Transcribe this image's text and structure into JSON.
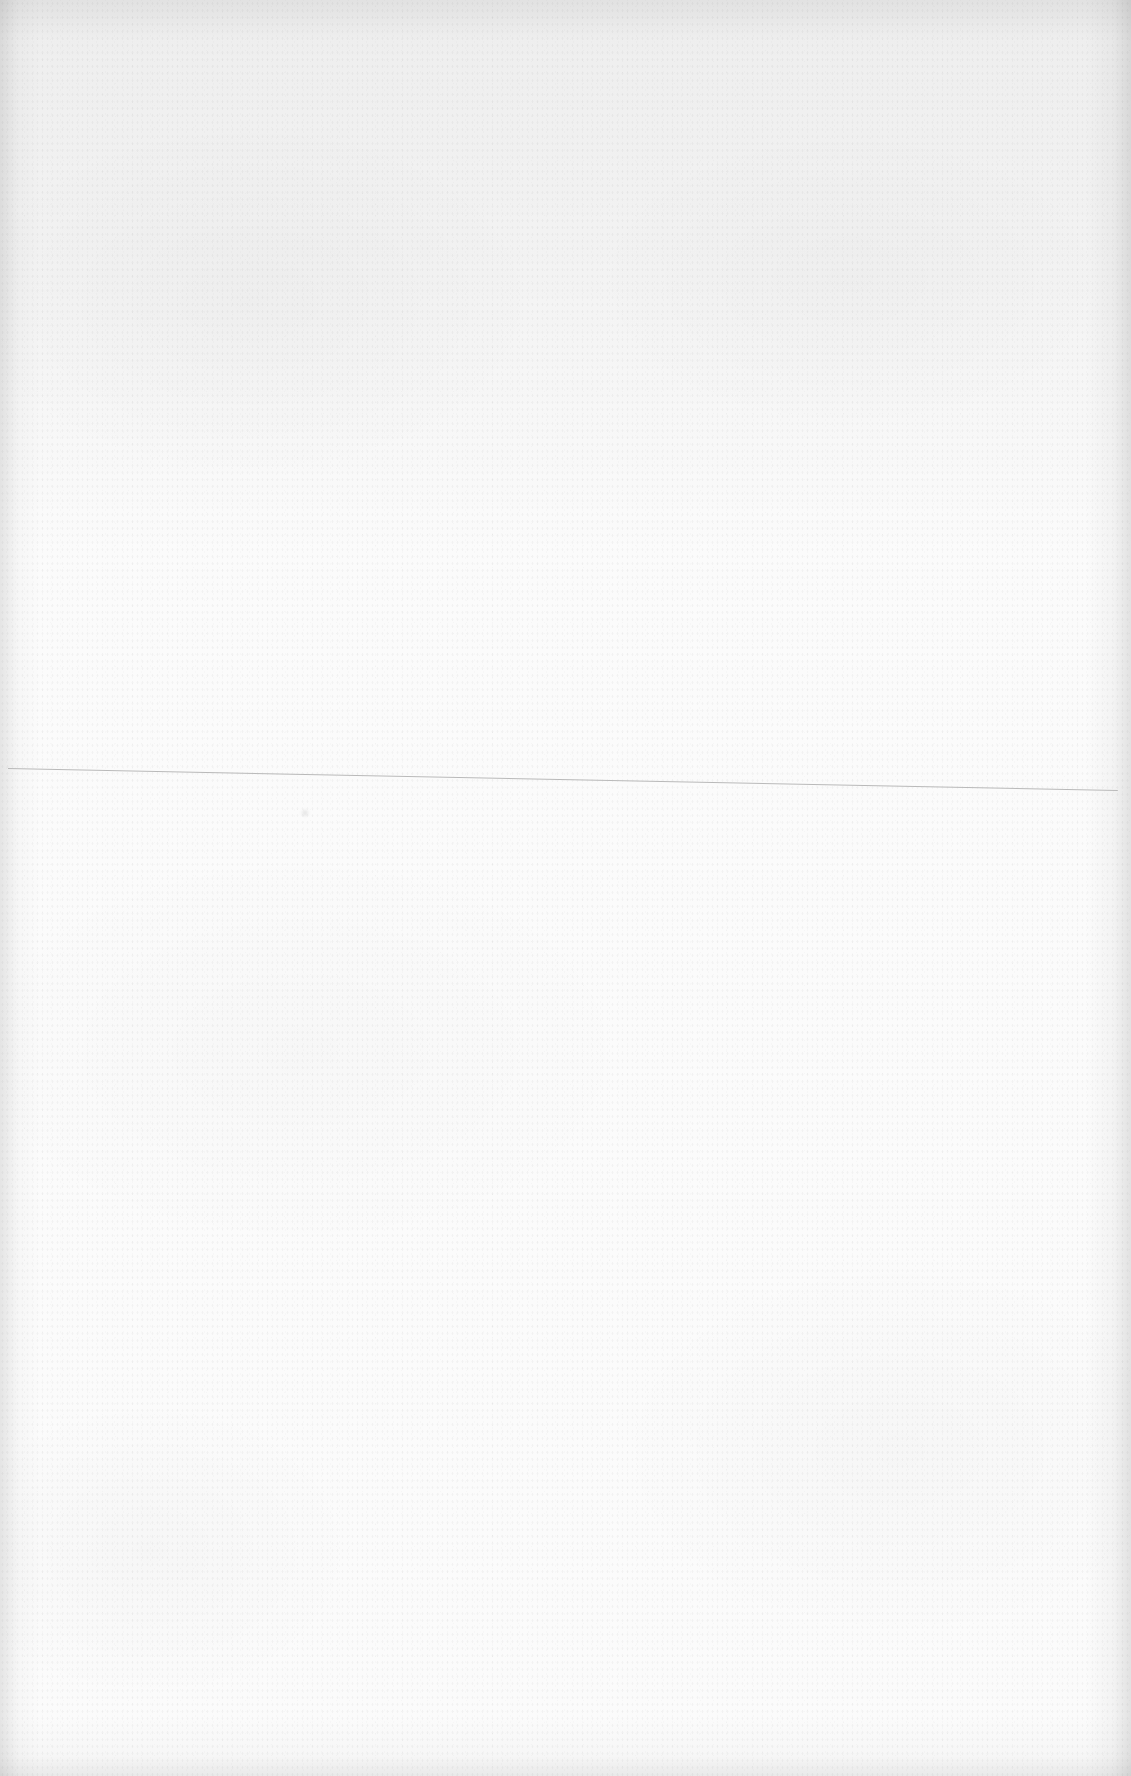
{
  "document": {
    "type": "blank scanned page",
    "text": [],
    "colors": {
      "paper": "#fbfbfb",
      "edge_shadow": "#e9e9e9",
      "rule_line": "#b9b9b9"
    },
    "rule": {
      "x1": 8,
      "y1": 768,
      "x2": 1118,
      "y2": 790,
      "thickness": 1
    }
  }
}
